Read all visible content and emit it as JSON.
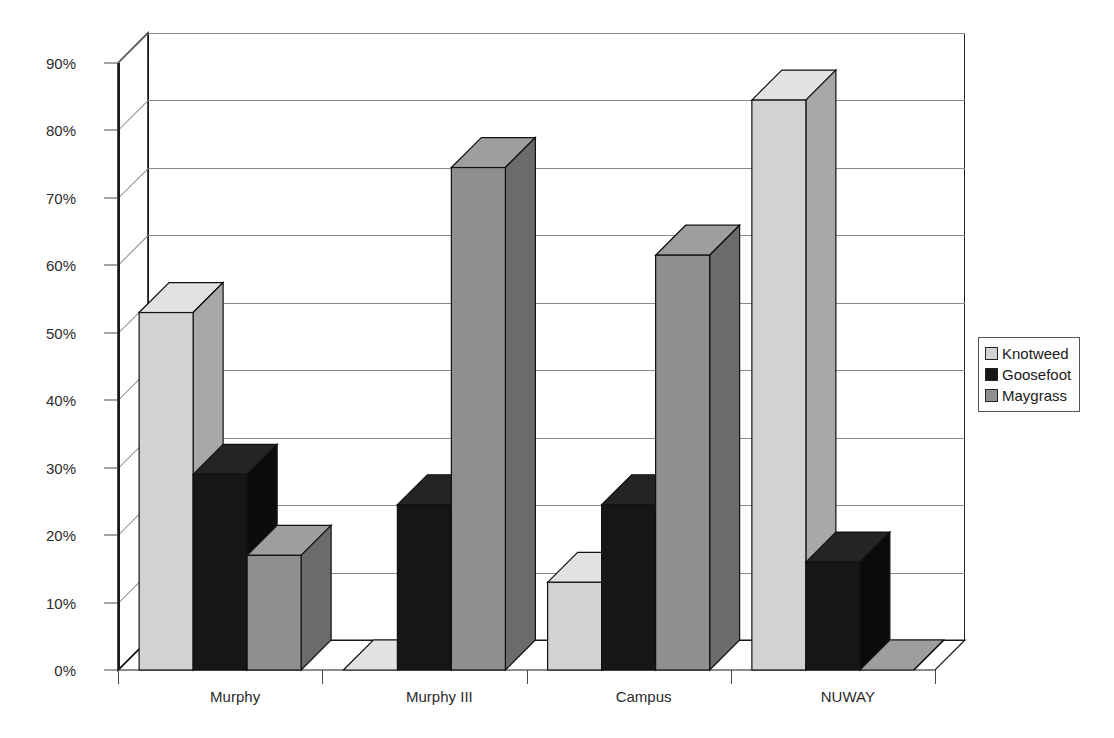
{
  "chart_data": {
    "type": "bar",
    "title": "",
    "subtitle": "",
    "xlabel": "",
    "ylabel": "",
    "categories": [
      "Murphy",
      "Murphy III",
      "Campus",
      "NUWAY"
    ],
    "series": [
      {
        "name": "Knotweed",
        "color": "#d2d2d2",
        "side_color": "#a8a8a8",
        "top_color": "#e2e2e2",
        "values": [
          53,
          0,
          13,
          84.5
        ]
      },
      {
        "name": "Goosefoot",
        "color": "#161616",
        "side_color": "#0b0b0b",
        "top_color": "#242424",
        "values": [
          29,
          24.5,
          24.5,
          16
        ]
      },
      {
        "name": "Maygrass",
        "color": "#8f8f8f",
        "side_color": "#6b6b6b",
        "top_color": "#9e9e9e",
        "values": [
          17,
          74.5,
          61.5,
          0
        ]
      }
    ],
    "ylim": [
      0,
      90
    ],
    "ytick_values": [
      0,
      10,
      20,
      30,
      40,
      50,
      60,
      70,
      80,
      90
    ],
    "ytick_labels": [
      "0%",
      "10%",
      "20%",
      "30%",
      "40%",
      "50%",
      "60%",
      "70%",
      "80%",
      "90%"
    ],
    "grid": true,
    "legend_position": "right",
    "value_format": "percent",
    "projection": "3d-bar"
  },
  "legend": {
    "entries": [
      {
        "label": "Knotweed"
      },
      {
        "label": "Goosefoot"
      },
      {
        "label": "Maygrass"
      }
    ]
  },
  "axes": {
    "y_labels": [
      "90%",
      "80%",
      "70%",
      "60%",
      "50%",
      "40%",
      "30%",
      "20%",
      "10%",
      "0%"
    ],
    "x_labels": [
      "Murphy",
      "Murphy III",
      "Campus",
      "NUWAY"
    ]
  }
}
